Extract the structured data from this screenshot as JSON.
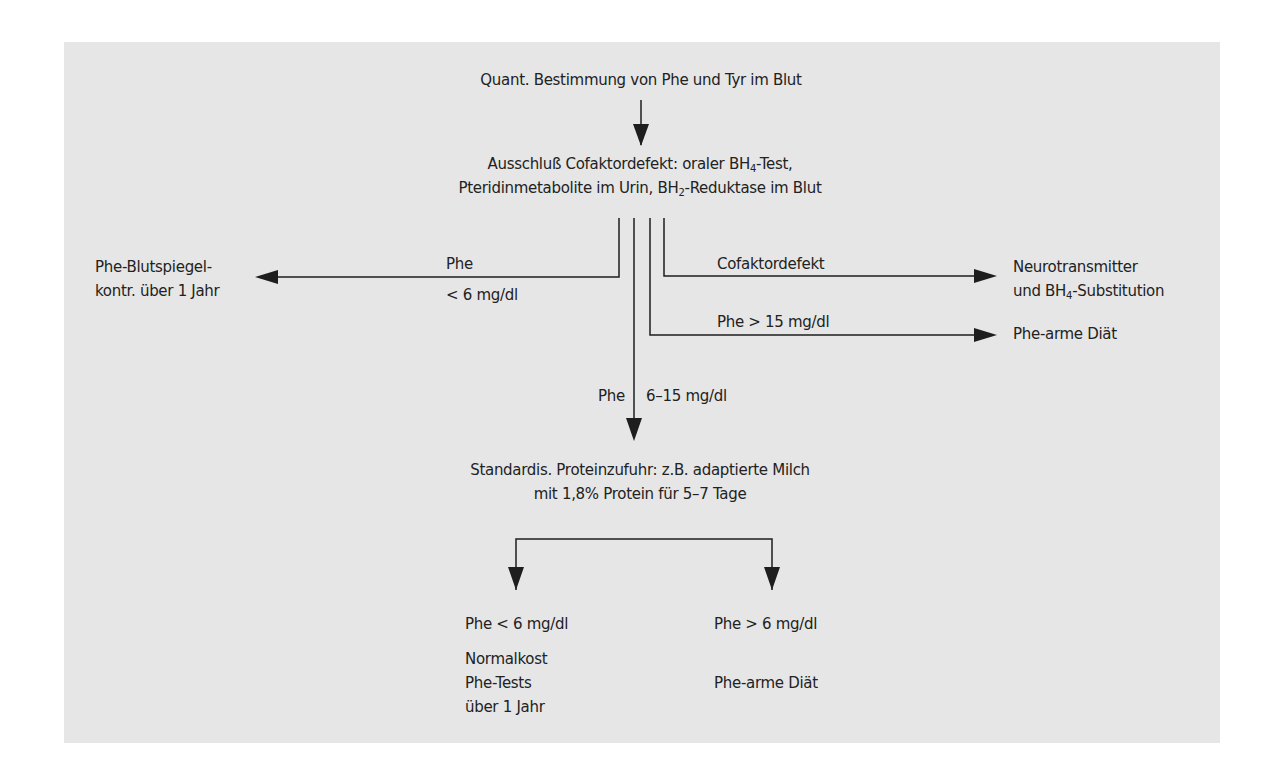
{
  "diagram": {
    "type": "flowchart",
    "background_color": "#e6e6e6",
    "line_color": "#1e1e1e",
    "nodes": {
      "start": {
        "label": "Quant. Bestimmung von Phe und Tyr im Blut"
      },
      "cofactor_exclusion": {
        "line1_a": "Ausschluß Cofaktordefekt: oraler BH",
        "line1_sub": "4",
        "line1_b": "-Test,",
        "line2_a": "Pteridinmetabolite im Urin, BH",
        "line2_sub": "2",
        "line2_b": "-Reduktase im Blut"
      },
      "blood_level_control": {
        "line1": "Phe-Blutspiegel-",
        "line2": "kontr. über 1 Jahr"
      },
      "neurotransmitter": {
        "line1": "Neurotransmitter",
        "line2_a": "und BH",
        "line2_sub": "4",
        "line2_b": "-Substitution"
      },
      "phe_poor_diet_1": {
        "label": "Phe-arme Diät"
      },
      "standard_protein": {
        "line1": "Standardis. Proteinzufuhr: z.B. adaptierte Milch",
        "line2": "mit 1,8% Protein für 5–7 Tage"
      },
      "normal_diet": {
        "condition": "Phe < 6 mg/dl",
        "line1": "Normalkost",
        "line2": "Phe-Tests",
        "line3": "über 1 Jahr"
      },
      "phe_poor_diet_2": {
        "condition": "Phe > 6 mg/dl",
        "label": "Phe-arme Diät"
      }
    },
    "edges": {
      "low": {
        "label_top": "Phe",
        "label_bottom": "< 6 mg/dl"
      },
      "cofactor": {
        "label": "Cofaktordefekt"
      },
      "high": {
        "label": "Phe > 15 mg/dl"
      },
      "mid": {
        "label_left": "Phe",
        "label_right": "6–15 mg/dl"
      }
    }
  }
}
